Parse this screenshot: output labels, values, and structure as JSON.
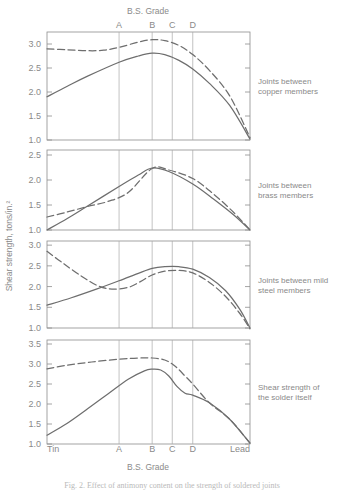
{
  "figure": {
    "top_axis_title": "B.S. Grade",
    "bottom_axis_title": "B.S. Grade",
    "y_axis_title": "Shear strength, tons/in.²",
    "left_end_label": "Tin",
    "right_end_label": "Lead",
    "caption": "Fig. 2.  Effect of antimony content on the strength of soldered joints"
  },
  "grade_ticks": [
    {
      "label": "A",
      "x": 0.355
    },
    {
      "label": "B",
      "x": 0.518
    },
    {
      "label": "C",
      "x": 0.617
    },
    {
      "label": "D",
      "x": 0.718
    }
  ],
  "legend": {
    "solid_name": "solid-line-series",
    "dashed_name": "dashed-line-series"
  },
  "chart_data": [
    {
      "type": "line",
      "panel_index": 1,
      "title": "Joints between copper members",
      "xlabel": "B.S. Grade",
      "ylabel": "Shear strength, tons/in.²",
      "ylim": [
        1.0,
        3.25
      ],
      "yticks": [
        "3.0",
        "2.5",
        "2.0",
        "1.5",
        "1.0"
      ],
      "ytick_values": [
        3.0,
        2.5,
        2.0,
        1.5,
        1.0
      ],
      "xlim": [
        0,
        1
      ],
      "grid": true,
      "series": [
        {
          "name": "solid",
          "style": "solid",
          "x": [
            0.0,
            0.1,
            0.2,
            0.355,
            0.45,
            0.518,
            0.58,
            0.65,
            0.718,
            0.8,
            0.9,
            1.0
          ],
          "values": [
            1.9,
            2.12,
            2.33,
            2.62,
            2.75,
            2.81,
            2.78,
            2.66,
            2.48,
            2.18,
            1.72,
            1.02
          ]
        },
        {
          "name": "dashed",
          "style": "dashed",
          "x": [
            0.0,
            0.1,
            0.2,
            0.28,
            0.355,
            0.45,
            0.518,
            0.58,
            0.65,
            0.718,
            0.8,
            0.9,
            1.0
          ],
          "values": [
            2.9,
            2.88,
            2.86,
            2.87,
            2.93,
            3.04,
            3.09,
            3.07,
            2.97,
            2.78,
            2.45,
            1.92,
            1.05
          ]
        }
      ]
    },
    {
      "type": "line",
      "panel_index": 2,
      "title": "Joints between brass members",
      "xlabel": "B.S. Grade",
      "ylabel": "Shear strength, tons/in.²",
      "ylim": [
        1.0,
        2.6
      ],
      "yticks": [
        "2.5",
        "2.0",
        "1.5",
        "1.0"
      ],
      "ytick_values": [
        2.5,
        2.0,
        1.5,
        1.0
      ],
      "xlim": [
        0,
        1
      ],
      "grid": true,
      "series": [
        {
          "name": "solid",
          "style": "solid",
          "x": [
            0.0,
            0.1,
            0.2,
            0.355,
            0.45,
            0.518,
            0.6,
            0.718,
            0.82,
            0.92,
            1.0
          ],
          "values": [
            1.0,
            1.23,
            1.48,
            1.87,
            2.1,
            2.24,
            2.17,
            1.92,
            1.62,
            1.3,
            1.0
          ]
        },
        {
          "name": "dashed",
          "style": "dashed",
          "x": [
            0.0,
            0.1,
            0.2,
            0.3,
            0.4,
            0.518,
            0.6,
            0.718,
            0.82,
            0.92,
            1.0
          ],
          "values": [
            1.26,
            1.36,
            1.47,
            1.57,
            1.75,
            2.23,
            2.2,
            2.03,
            1.72,
            1.35,
            1.0
          ]
        }
      ]
    },
    {
      "type": "line",
      "panel_index": 3,
      "title": "Joints between mild steel members",
      "xlabel": "B.S. Grade",
      "ylabel": "Shear strength, tons/in.²",
      "ylim": [
        1.0,
        3.1
      ],
      "yticks": [
        "3.0",
        "2.5",
        "2.0",
        "1.5",
        "1.0"
      ],
      "ytick_values": [
        3.0,
        2.5,
        2.0,
        1.5,
        1.0
      ],
      "xlim": [
        0,
        1
      ],
      "grid": true,
      "series": [
        {
          "name": "solid",
          "style": "solid",
          "x": [
            0.0,
            0.12,
            0.25,
            0.355,
            0.45,
            0.518,
            0.58,
            0.65,
            0.718,
            0.8,
            0.88,
            0.95,
            1.0
          ],
          "values": [
            1.55,
            1.73,
            1.95,
            2.14,
            2.32,
            2.44,
            2.48,
            2.48,
            2.42,
            2.22,
            1.9,
            1.45,
            1.0
          ]
        },
        {
          "name": "dashed",
          "style": "dashed",
          "x": [
            0.0,
            0.08,
            0.17,
            0.25,
            0.32,
            0.4,
            0.46,
            0.518,
            0.58,
            0.65,
            0.718,
            0.8,
            0.88,
            0.95,
            1.0
          ],
          "values": [
            2.85,
            2.56,
            2.25,
            2.02,
            1.94,
            1.98,
            2.12,
            2.28,
            2.37,
            2.39,
            2.33,
            2.1,
            1.76,
            1.35,
            0.98
          ]
        }
      ]
    },
    {
      "type": "line",
      "panel_index": 4,
      "title": "Shear strength of the solder itself",
      "xlabel": "B.S. Grade",
      "ylabel": "Shear strength, tons/in.²",
      "ylim": [
        1.0,
        3.6
      ],
      "yticks": [
        "3.5",
        "3.0",
        "2.5",
        "2.0",
        "1.5",
        "1.0"
      ],
      "ytick_values": [
        3.5,
        3.0,
        2.5,
        2.0,
        1.5,
        1.0
      ],
      "xlim": [
        0,
        1
      ],
      "grid": true,
      "series": [
        {
          "name": "solid",
          "style": "solid",
          "x": [
            0.0,
            0.1,
            0.2,
            0.3,
            0.4,
            0.48,
            0.518,
            0.56,
            0.6,
            0.64,
            0.68,
            0.718,
            0.8,
            0.9,
            1.0
          ],
          "values": [
            1.22,
            1.52,
            1.88,
            2.25,
            2.62,
            2.83,
            2.87,
            2.85,
            2.7,
            2.44,
            2.27,
            2.22,
            2.03,
            1.62,
            1.02
          ]
        },
        {
          "name": "dashed",
          "style": "dashed",
          "x": [
            0.0,
            0.1,
            0.22,
            0.355,
            0.45,
            0.518,
            0.58,
            0.63,
            0.68,
            0.718,
            0.8,
            0.9,
            1.0
          ],
          "values": [
            2.88,
            2.97,
            3.05,
            3.12,
            3.15,
            3.15,
            3.1,
            2.95,
            2.7,
            2.5,
            2.03,
            1.62,
            1.02
          ]
        }
      ]
    }
  ]
}
